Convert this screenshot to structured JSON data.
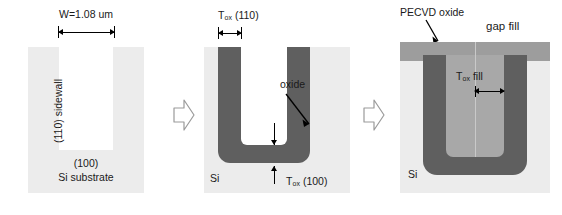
{
  "figure": {
    "colors": {
      "silicon": "#ececec",
      "void": "#ffffff",
      "thermal_oxide": "#5f5f5f",
      "gap_fill_oxide": "#a8a8a8",
      "pecvd_oxide": "#9d9d9d",
      "text": "#1a1a1a",
      "arrow_outline": "#9a9a9a"
    }
  },
  "panels": [
    {
      "id": "panel-1",
      "name": "etched-trench",
      "labels": {
        "width_dimension": "W=1.08 um",
        "sidewall": "(110) sidewall",
        "bottom_plane": "(100)",
        "substrate": "Si substrate"
      }
    },
    {
      "id": "panel-2",
      "name": "thermal-oxide-liner",
      "labels": {
        "tox_sidewall_prefix": "T",
        "tox_sidewall_sub": "ox",
        "tox_sidewall_suffix": " (110)",
        "oxide": "oxide",
        "tox_bottom_prefix": "T",
        "tox_bottom_sub": "ox",
        "tox_bottom_suffix": " (100)",
        "substrate": "Si"
      }
    },
    {
      "id": "panel-3",
      "name": "pecvd-gap-fill",
      "labels": {
        "pecvd": "PECVD oxide",
        "gap_fill": "gap fill",
        "tox_fill_prefix": "T",
        "tox_fill_sub": "ox",
        "tox_fill_suffix": " fill",
        "substrate": "Si"
      }
    }
  ],
  "step_arrows": [
    {
      "name": "step-arrow-1",
      "direction": "right"
    },
    {
      "name": "step-arrow-2",
      "direction": "right"
    }
  ]
}
